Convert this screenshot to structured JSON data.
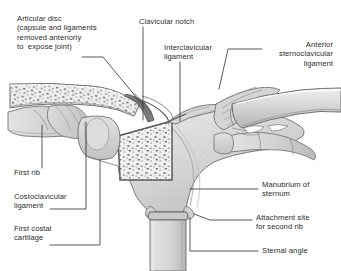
{
  "figure": {
    "background_color": "#ffffff",
    "text_color": "#2b2b2b",
    "leader_line_color": "#3a3a3a",
    "bone_fill": "#d9d9d9",
    "bone_outline": "#6b6b6b",
    "cut_bone_fill": "#eeeeee",
    "cut_bone_border": "#5a5a5a",
    "trabecular_dot_color": "#6f6f6f",
    "cartilage_fill": "#d2d2d2",
    "ligament_fill": "#cfcfcf"
  },
  "labels": [
    {
      "id": "articular-disc",
      "lines": [
        "Articular disc",
        "(capsule and ligaments",
        "removed anteriorly",
        "to  expose joint)"
      ],
      "text": "Articular disc\n(capsule and ligaments\nremoved anteriorly\nto  expose joint)",
      "align": "left",
      "x": 17,
      "y": 14
    },
    {
      "id": "clavicular-notch",
      "lines": [
        "Clavicular notch"
      ],
      "text": "Clavicular notch",
      "align": "left",
      "x": 139,
      "y": 17
    },
    {
      "id": "interclavicular-ligament",
      "lines": [
        "Interclavicular",
        "ligament"
      ],
      "text": "Interclavicular\nligament",
      "align": "left",
      "x": 164,
      "y": 43
    },
    {
      "id": "anterior-sternoclavicular-ligament",
      "lines": [
        "Anterior",
        "sternoclavicular",
        "ligament"
      ],
      "text": "Anterior\nsternoclavicular\nligament",
      "align": "right",
      "x": 333,
      "y": 40
    },
    {
      "id": "first-rib",
      "lines": [
        "First rib"
      ],
      "text": "First rib",
      "align": "left",
      "x": 14,
      "y": 168
    },
    {
      "id": "costoclavicular-ligament",
      "lines": [
        "Costoclavicular",
        "ligament"
      ],
      "text": "Costoclavicular\nligament",
      "align": "left",
      "x": 14,
      "y": 192
    },
    {
      "id": "first-costal-cartilage",
      "lines": [
        "First costal",
        "cartilage"
      ],
      "text": "First costal\ncartilage",
      "align": "left",
      "x": 14,
      "y": 224
    },
    {
      "id": "manubrium-of-sternum",
      "lines": [
        "Manubrium of",
        "sternum"
      ],
      "text": "Manubrium of\nsternum",
      "align": "left",
      "x": 262,
      "y": 180
    },
    {
      "id": "attachment-site-second-rib",
      "lines": [
        "Attachment site",
        "for second rib"
      ],
      "text": "Attachment site\nfor second rib",
      "align": "left",
      "x": 256,
      "y": 213
    },
    {
      "id": "sternal-angle",
      "lines": [
        "Sternal angle"
      ],
      "text": "Sternal angle",
      "align": "left",
      "x": 262,
      "y": 246
    }
  ],
  "anatomy_parts": [
    "left-clavicle-cut",
    "right-clavicle",
    "articular-disc",
    "interclavicular-ligament",
    "anterior-sternoclavicular-ligament",
    "manubrium-of-sternum",
    "manubrium-cut-section",
    "first-rib-left",
    "first-costal-cartilage-left",
    "costoclavicular-ligament",
    "first-rib-right",
    "first-costal-cartilage-right",
    "sternal-angle",
    "body-of-sternum",
    "second-rib-attachment-left",
    "second-rib-attachment-right"
  ]
}
